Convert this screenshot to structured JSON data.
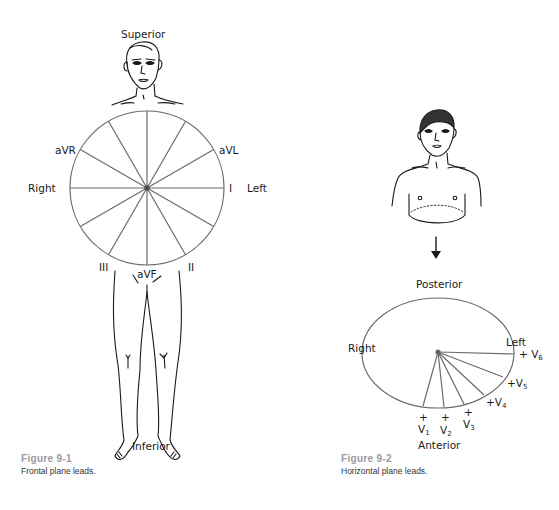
{
  "figure1": {
    "caption_number": "Figure 9-1",
    "caption_text": "Frontal plane leads.",
    "labels": {
      "superior": "Superior",
      "inferior": "Inferior",
      "right": "Right",
      "left": "Left",
      "avr": "aVR",
      "avl": "aVL",
      "avf": "aVF",
      "lead_i": "I",
      "lead_ii": "II",
      "lead_iii": "III"
    }
  },
  "figure2": {
    "caption_number": "Figure 9-2",
    "caption_text": "Horizontal plane leads.",
    "labels": {
      "posterior": "Posterior",
      "anterior": "Anterior",
      "right": "Right",
      "left": "Left",
      "plus": "+",
      "v": "V",
      "v1_sub": "1",
      "v2_sub": "2",
      "v3_sub": "3",
      "v4_sub": "4",
      "v5_sub": "5",
      "v6_sub": "6"
    }
  },
  "colors": {
    "line": "#6b6b6b",
    "ink": "#1a1a1a",
    "caption_number": "#9a9a9a"
  }
}
